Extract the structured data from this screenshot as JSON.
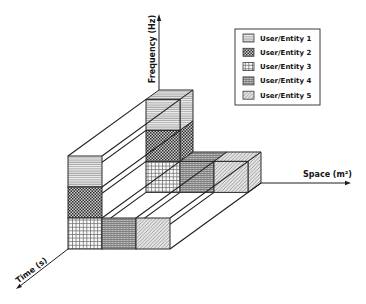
{
  "diagram": {
    "axes": {
      "frequency": "Frequency (Hz)",
      "space": "Space (m²)",
      "time": "Time (s)"
    },
    "legend": [
      {
        "label": "User/Entity 1",
        "pattern": "horizontal-lines"
      },
      {
        "label": "User/Entity 2",
        "pattern": "dark-checker"
      },
      {
        "label": "User/Entity 3",
        "pattern": "square-grid"
      },
      {
        "label": "User/Entity 4",
        "pattern": "dense-gray"
      },
      {
        "label": "User/Entity 5",
        "pattern": "diagonal-hatch"
      }
    ],
    "time_slots": {
      "front": {
        "space_0": [
          "User/Entity 3",
          "User/Entity 2",
          "User/Entity 1"
        ],
        "space_1": [
          "User/Entity 4"
        ],
        "space_2": [
          "User/Entity 5"
        ]
      },
      "back": {
        "space_0": [
          "User/Entity 3",
          "User/Entity 2",
          "User/Entity 1"
        ],
        "space_1": [
          "User/Entity 4"
        ],
        "space_2": [
          "User/Entity 5"
        ]
      }
    }
  },
  "colors": {
    "background": "#ffffff",
    "lines": "#1e1e1e",
    "entity_1_fill": "#efefef",
    "entity_2_fill": "#555555",
    "entity_3_fill": "#f4f4f4",
    "entity_4_fill": "#9a9a9a",
    "entity_5_fill": "#e2e2e2"
  }
}
